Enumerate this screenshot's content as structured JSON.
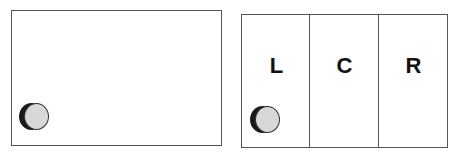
{
  "left_panel": {
    "object": "puck-icon"
  },
  "right_panel": {
    "zones": [
      {
        "label": "L"
      },
      {
        "label": "C"
      },
      {
        "label": "R"
      }
    ],
    "object_zone": "L"
  }
}
